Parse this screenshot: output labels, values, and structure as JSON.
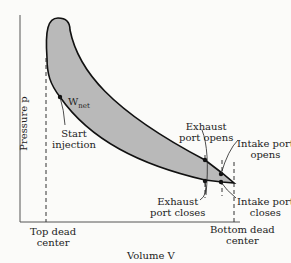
{
  "diagram": {
    "type": "pV diagram (diesel/two-stroke cycle)",
    "y_axis_label": "Pressure p",
    "x_axis_label": "Volume V",
    "work_label": "W",
    "work_subscript": "net",
    "annotations": {
      "start_injection": [
        "Start",
        "injection"
      ],
      "exhaust_port_opens": [
        "Exhaust",
        "port opens"
      ],
      "intake_port_opens": [
        "Intake port",
        "opens"
      ],
      "exhaust_port_closes": [
        "Exhaust",
        "port closes"
      ],
      "intake_port_closes": [
        "Intake port",
        "closes"
      ],
      "top_dead_center": [
        "Top dead",
        "center"
      ],
      "bottom_dead_center": [
        "Bottom dead",
        "center"
      ]
    },
    "colors": {
      "fill": "#b9b9b9",
      "line": "#111111",
      "background": "#fbfbf9"
    }
  }
}
